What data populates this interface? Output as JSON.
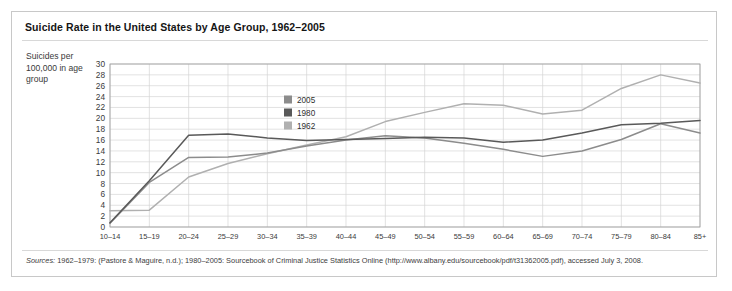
{
  "figure": {
    "title": "Suicide Rate in the United States by Age Group, 1962–2005",
    "y_axis_caption": "Suicides per 100,000 in age group",
    "sources_label": "Sources:",
    "sources_text": " 1962–1979: (Pastore & Maguire, n.d.); 1980–2005: Sourcebook of Criminal Justice Statistics Online (http://www.albany.edu/sourcebook/pdf/t31362005.pdf), accessed July 3, 2008.",
    "border_color": "#c8c8c8",
    "background": "#ffffff"
  },
  "chart_data": {
    "type": "line",
    "title": "Suicide Rate in the United States by Age Group, 1962–2005",
    "xlabel": "Age group",
    "ylabel": "Suicides per 100,000 in age group",
    "ylim": [
      0,
      30
    ],
    "ytick_step": 2,
    "yticks": [
      0,
      2,
      4,
      6,
      8,
      10,
      12,
      14,
      16,
      18,
      20,
      22,
      24,
      26,
      28,
      30
    ],
    "grid": true,
    "legend_position": "inside-upper-left",
    "categories": [
      "10–14",
      "15–19",
      "20–24",
      "25–29",
      "30–34",
      "35–39",
      "40–44",
      "45–49",
      "50–54",
      "55–59",
      "60–64",
      "65–69",
      "70–74",
      "75–79",
      "80–84",
      "85+"
    ],
    "series": [
      {
        "name": "2005",
        "color": "#8c8c8c",
        "values": [
          0.7,
          8.2,
          12.8,
          12.9,
          13.6,
          14.9,
          16.0,
          16.8,
          16.4,
          15.4,
          14.3,
          13.0,
          14.0,
          16.1,
          19.0,
          17.3
        ]
      },
      {
        "name": "1980",
        "color": "#595959",
        "values": [
          0.8,
          8.5,
          16.9,
          17.1,
          16.4,
          15.9,
          16.1,
          16.3,
          16.5,
          16.4,
          15.6,
          16.0,
          17.3,
          18.8,
          19.1,
          19.6
        ]
      },
      {
        "name": "1962",
        "color": "#b0b0b0",
        "values": [
          3.0,
          3.1,
          9.2,
          11.7,
          13.5,
          15.1,
          16.6,
          19.4,
          21.1,
          22.7,
          22.4,
          20.8,
          21.5,
          25.5,
          28.0,
          26.5
        ]
      }
    ],
    "legend": [
      {
        "label": "2005",
        "color": "#8c8c8c"
      },
      {
        "label": "1980",
        "color": "#595959"
      },
      {
        "label": "1962",
        "color": "#b0b0b0"
      }
    ]
  }
}
